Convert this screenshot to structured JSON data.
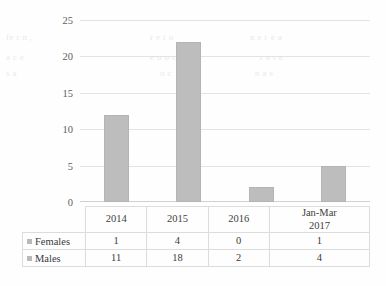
{
  "chart_data": {
    "type": "bar",
    "title": "",
    "xlabel": "",
    "ylabel": "",
    "categories": [
      "2014",
      "2015",
      "2016",
      "Jan-Mar 2017"
    ],
    "category_lines": [
      [
        "2014"
      ],
      [
        "2015"
      ],
      [
        "2016"
      ],
      [
        "Jan-Mar",
        "2017"
      ]
    ],
    "series": [
      {
        "name": "Females",
        "values": [
          1,
          4,
          0,
          1
        ]
      },
      {
        "name": "Males",
        "values": [
          11,
          18,
          2,
          4
        ]
      }
    ],
    "plotted_series": {
      "name": "Total",
      "values": [
        12,
        22,
        2,
        5
      ]
    },
    "ylim": [
      0,
      25
    ],
    "yticks": [
      0,
      5,
      10,
      15,
      20,
      25
    ],
    "ytick_labels": [
      "0",
      "5",
      "10",
      "15",
      "20",
      "25"
    ],
    "grid": true,
    "legend_position": "data-table-left",
    "bar_color": "#bdbdbd",
    "gridline_color": "#e3e3e3",
    "text_color": "#3a3a3a"
  },
  "data_table": {
    "header_blank": "",
    "columns": [
      "2014",
      "2015",
      "2016",
      "Jan-Mar 2017"
    ],
    "rows": [
      {
        "label": "Females",
        "marker": "legend-swatch",
        "cells": [
          "1",
          "4",
          "0",
          "1"
        ]
      },
      {
        "label": "Males",
        "marker": "legend-swatch",
        "cells": [
          "11",
          "18",
          "2",
          "4"
        ]
      }
    ]
  },
  "artifacts": {
    "lines": [
      {
        "text": "fe r  n ,",
        "x": 6,
        "y": 36
      },
      {
        "text": "a c  e",
        "x": 6,
        "y": 56
      },
      {
        "text": "s a",
        "x": 6,
        "y": 72
      },
      {
        "text": "r e  t  o",
        "x": 150,
        "y": 36
      },
      {
        "text": "n  e r  e a",
        "x": 230,
        "y": 36
      },
      {
        "text": "e  n  o  c",
        "x": 150,
        "y": 56
      },
      {
        "text": "r  a  t  e",
        "x": 250,
        "y": 56
      },
      {
        "text": "o  c",
        "x": 160,
        "y": 72
      },
      {
        "text": "n  a  s",
        "x": 250,
        "y": 72
      }
    ]
  }
}
